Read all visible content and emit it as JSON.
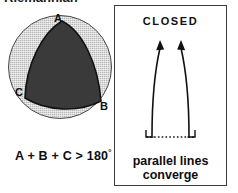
{
  "figure": {
    "title": "Riemannian",
    "sphere_panel": {
      "vertex_labels": {
        "a": "A",
        "b": "B",
        "c": "C"
      },
      "angle_sum_text": "A + B + C > 180",
      "degree_symbol": "°",
      "disc_color": "#b9b9b9",
      "triangle_color": "#3a3a3a",
      "outline_color": "#121212"
    },
    "closed_panel": {
      "heading": "CLOSED",
      "caption_line_1": "parallel lines",
      "caption_line_2": "converge",
      "border_color": "#3c3c3c",
      "line_color": "#111111"
    }
  }
}
